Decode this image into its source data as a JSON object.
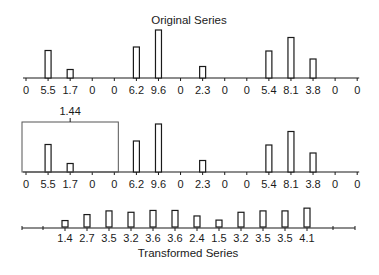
{
  "titles": {
    "top": "Original Series",
    "bottom": "Transformed Series"
  },
  "window_label": "1.44",
  "colors": {
    "stroke": "#1a1a1a",
    "bar_fill": "#ffffff",
    "background": "#ffffff"
  },
  "chart_data": [
    {
      "type": "bar",
      "title": "Original Series",
      "categories": [
        "0",
        "5.5",
        "1.7",
        "0",
        "0",
        "6.2",
        "9.6",
        "0",
        "2.3",
        "0",
        "0",
        "5.4",
        "8.1",
        "3.8",
        "0",
        "0"
      ],
      "values": [
        0,
        5.5,
        1.7,
        0,
        0,
        6.2,
        9.6,
        0,
        2.3,
        0,
        0,
        5.4,
        8.1,
        3.8,
        0,
        0
      ],
      "grid": false
    },
    {
      "type": "bar",
      "title": "Original Series (with moving window)",
      "categories": [
        "0",
        "5.5",
        "1.7",
        "0",
        "0",
        "6.2",
        "9.6",
        "0",
        "2.3",
        "0",
        "0",
        "5.4",
        "8.1",
        "3.8",
        "0",
        "0"
      ],
      "values": [
        0,
        5.5,
        1.7,
        0,
        0,
        6.2,
        9.6,
        0,
        2.3,
        0,
        0,
        5.4,
        8.1,
        3.8,
        0,
        0
      ],
      "annotations": [
        {
          "text": "1.44",
          "window_start_index": 0,
          "window_end_index": 4
        }
      ],
      "grid": false
    },
    {
      "type": "bar",
      "title": "Transformed Series",
      "categories": [
        "1.4",
        "2.7",
        "3.5",
        "3.2",
        "3.6",
        "3.6",
        "2.4",
        "1.5",
        "3.2",
        "3.5",
        "3.5",
        "4.1"
      ],
      "values": [
        1.4,
        2.7,
        3.5,
        3.2,
        3.6,
        3.6,
        2.4,
        1.5,
        3.2,
        3.5,
        3.5,
        4.1
      ],
      "grid": false
    }
  ]
}
